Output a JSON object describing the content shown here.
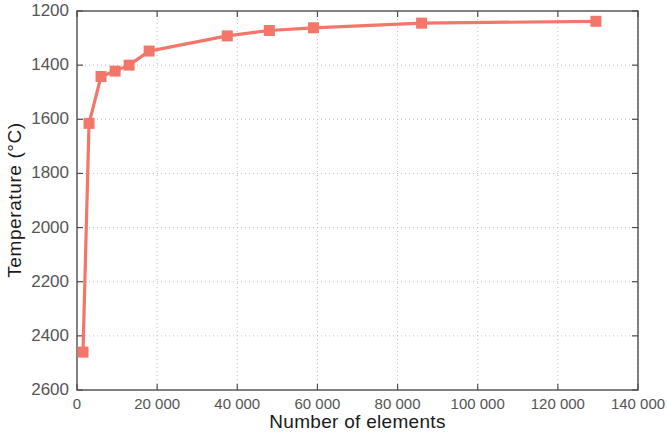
{
  "chart_data": {
    "type": "line",
    "title": "",
    "xlabel": "Number of elements",
    "ylabel": "Temperature (°C)",
    "xlim": [
      0,
      140000
    ],
    "ylim": [
      1200,
      2600
    ],
    "y_inverted": true,
    "grid": true,
    "grid_style": "dotted",
    "legend": null,
    "series_color": "#F4766A",
    "marker": "square",
    "x_tick_labels": [
      "0",
      "20 000",
      "40 000",
      "60 000",
      "80 000",
      "100 000",
      "120 000",
      "140 000"
    ],
    "x_ticks": [
      0,
      20000,
      40000,
      60000,
      80000,
      100000,
      120000,
      140000
    ],
    "y_tick_labels": [
      "1200",
      "1400",
      "1600",
      "1800",
      "2000",
      "2200",
      "2400",
      "2600"
    ],
    "y_ticks": [
      1200,
      1400,
      1600,
      1800,
      2000,
      2200,
      2400,
      2600
    ],
    "series": [
      {
        "name": "Temperature vs mesh size",
        "x": [
          1500,
          3000,
          6000,
          9500,
          13000,
          18000,
          37500,
          48000,
          59000,
          86000,
          129500
        ],
        "values": [
          2460,
          1615,
          1442,
          1422,
          1400,
          1348,
          1292,
          1272,
          1262,
          1245,
          1238
        ]
      }
    ]
  },
  "axis": {
    "y_label": "Temperature (°C)",
    "x_label": "Number of elements"
  }
}
